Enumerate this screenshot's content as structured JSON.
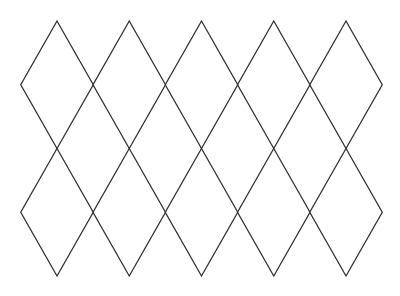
{
  "diagram": {
    "type": "diamond-lattice",
    "background": "#ffffff",
    "stroke_color": "#333333",
    "stroke_width": 1.3,
    "columns": 5,
    "rows": 2,
    "column_centers_x": [
      57,
      129.25,
      201.5,
      273.75,
      346
    ],
    "half_width": 36.25,
    "row_vertices_y": [
      21,
      84.75,
      148.5,
      212.25,
      276
    ],
    "diamonds": [
      {
        "row": 0,
        "col": 0
      },
      {
        "row": 0,
        "col": 1
      },
      {
        "row": 0,
        "col": 2
      },
      {
        "row": 0,
        "col": 3
      },
      {
        "row": 0,
        "col": 4
      },
      {
        "row": 1,
        "col": 0
      },
      {
        "row": 1,
        "col": 1
      },
      {
        "row": 1,
        "col": 2
      },
      {
        "row": 1,
        "col": 3
      },
      {
        "row": 1,
        "col": 4
      }
    ]
  }
}
